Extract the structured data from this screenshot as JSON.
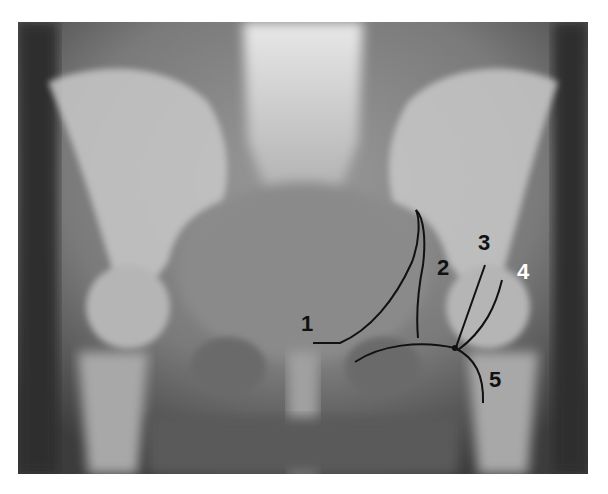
{
  "image": {
    "subject": "Anteroposterior pelvic radiograph",
    "annotation_color": "#111111",
    "highlight_label_color": "#ffffff"
  },
  "labels": [
    {
      "id": "1",
      "text": "1",
      "x": 301,
      "y": 313,
      "color": "#111111"
    },
    {
      "id": "2",
      "text": "2",
      "x": 437,
      "y": 257,
      "color": "#111111"
    },
    {
      "id": "3",
      "text": "3",
      "x": 478,
      "y": 232,
      "color": "#111111"
    },
    {
      "id": "4",
      "text": "4",
      "x": 517,
      "y": 261,
      "color": "#ffffff"
    },
    {
      "id": "5",
      "text": "5",
      "x": 489,
      "y": 369,
      "color": "#111111"
    }
  ]
}
